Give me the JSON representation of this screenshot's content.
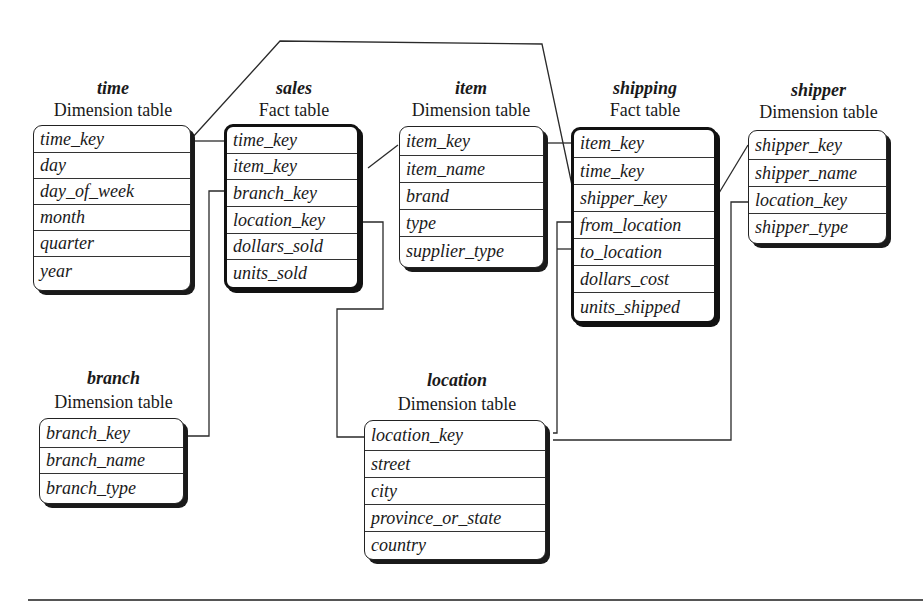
{
  "diagram": {
    "type": "fact constellation schema",
    "tables": {
      "time": {
        "name": "time",
        "kind": "Dimension table",
        "attributes": [
          "time_key",
          "day",
          "day_of_week",
          "month",
          "quarter",
          "year"
        ]
      },
      "sales": {
        "name": "sales",
        "kind": "Fact table",
        "attributes": [
          "time_key",
          "item_key",
          "branch_key",
          "location_key",
          "dollars_sold",
          "units_sold"
        ]
      },
      "item": {
        "name": "item",
        "kind": "Dimension table",
        "attributes": [
          "item_key",
          "item_name",
          "brand",
          "type",
          "supplier_type"
        ]
      },
      "shipping": {
        "name": "shipping",
        "kind": "Fact table",
        "attributes": [
          "item_key",
          "time_key",
          "shipper_key",
          "from_location",
          "to_location",
          "dollars_cost",
          "units_shipped"
        ]
      },
      "shipper": {
        "name": "shipper",
        "kind": "Dimension table",
        "attributes": [
          "shipper_key",
          "shipper_name",
          "location_key",
          "shipper_type"
        ]
      },
      "branch": {
        "name": "branch",
        "kind": "Dimension table",
        "attributes": [
          "branch_key",
          "branch_name",
          "branch_type"
        ]
      },
      "location": {
        "name": "location",
        "kind": "Dimension table",
        "attributes": [
          "location_key",
          "street",
          "city",
          "province_or_state",
          "country"
        ]
      }
    },
    "relationships": [
      {
        "from": "sales.time_key",
        "to": "time.time_key"
      },
      {
        "from": "sales.item_key",
        "to": "item.item_key"
      },
      {
        "from": "sales.branch_key",
        "to": "branch.branch_key"
      },
      {
        "from": "sales.location_key",
        "to": "location.location_key"
      },
      {
        "from": "shipping.item_key",
        "to": "item.item_key"
      },
      {
        "from": "shipping.time_key",
        "to": "time.time_key"
      },
      {
        "from": "shipping.shipper_key",
        "to": "shipper.shipper_key"
      },
      {
        "from": "shipping.from_location",
        "to": "location.location_key"
      },
      {
        "from": "shipping.to_location",
        "to": "location.location_key"
      },
      {
        "from": "shipper.location_key",
        "to": "location.location_key"
      }
    ]
  }
}
